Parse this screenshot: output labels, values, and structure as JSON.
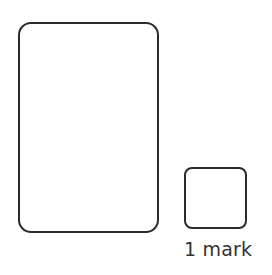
{
  "figure": {
    "background_color": "#ffffff",
    "stroke_color": "#2b2b2b",
    "text_color": "#333333",
    "canvas": {
      "width": 272,
      "height": 275
    },
    "shapes": [
      {
        "name": "large-rounded-rectangle",
        "kind": "rounded-rectangle",
        "x": 18,
        "y": 22,
        "width": 141,
        "height": 211,
        "corner_radius": 13,
        "stroke_width": 2.2,
        "stroke_color": "#2b2b2b",
        "fill": "#ffffff",
        "label": ""
      },
      {
        "name": "small-rounded-square",
        "kind": "rounded-square",
        "x": 184,
        "y": 167,
        "width": 63,
        "height": 62,
        "corner_radius": 8,
        "stroke_width": 2.2,
        "stroke_color": "#2b2b2b",
        "fill": "#ffffff",
        "label": "1 mark"
      }
    ],
    "caption": {
      "mark_label": "1 mark",
      "marks_value": "1",
      "marks_word": "mark"
    }
  }
}
